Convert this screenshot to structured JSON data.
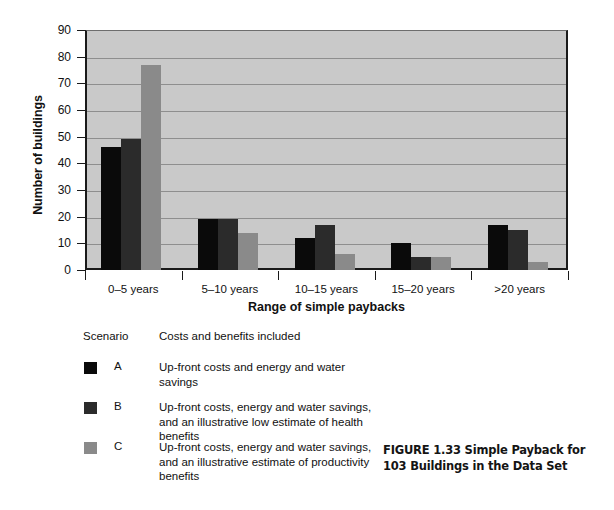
{
  "chart_data": {
    "type": "bar",
    "title": "",
    "xlabel": "Range of simple paybacks",
    "ylabel": "Number of buildings",
    "categories": [
      "0–5 years",
      "5–10 years",
      "10–15 years",
      "15–20 years",
      ">20 years"
    ],
    "series": [
      {
        "name": "A",
        "color": "#0a0a0a",
        "values": [
          46,
          19,
          12,
          10,
          17
        ]
      },
      {
        "name": "B",
        "color": "#2b2b2b",
        "values": [
          49,
          19,
          17,
          5,
          15
        ]
      },
      {
        "name": "C",
        "color": "#8a8a8a",
        "values": [
          77,
          14,
          6,
          5,
          3
        ]
      }
    ],
    "ylim": [
      0,
      90
    ],
    "yticks": [
      0,
      10,
      20,
      30,
      40,
      50,
      60,
      70,
      80,
      90
    ],
    "grid": true,
    "legend_position": "below-left",
    "plot_background": "#c9c9c9"
  },
  "legend": {
    "header_scenario": "Scenario",
    "header_costs": "Costs and benefits included",
    "entries": [
      {
        "key": "A",
        "color": "#0a0a0a",
        "description": "Up-front costs and energy and water savings"
      },
      {
        "key": "B",
        "color": "#2b2b2b",
        "description": "Up-front costs, energy and water savings, and an illustrative low estimate of health benefits"
      },
      {
        "key": "C",
        "color": "#8a8a8a",
        "description": "Up-front costs, energy and water savings, and an illustrative estimate of productivity benefits"
      }
    ]
  },
  "caption": {
    "text": "FIGURE 1.33 Simple Payback for 103 Buildings in the Data Set"
  }
}
